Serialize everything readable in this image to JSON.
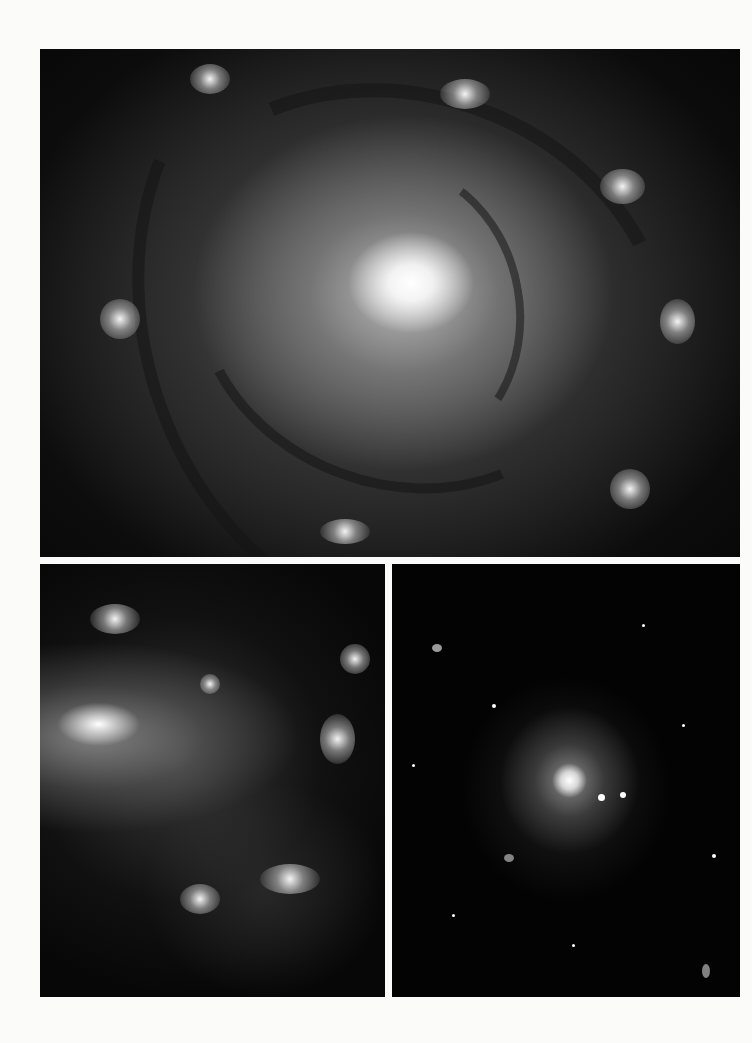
{
  "page": {
    "background_color": "#fbfbfa",
    "layout": "photo-plate: one wide image on top, two images side by side below"
  },
  "images": [
    {
      "id": "top",
      "subject": "face-on spiral galaxy with tightly wound arms and bright core",
      "rect": {
        "x": 40,
        "y": 49,
        "w": 700,
        "h": 508
      }
    },
    {
      "id": "bottom-left",
      "subject": "irregular galaxy close-up with bright knot and star-forming clusters",
      "rect": {
        "x": 40,
        "y": 564,
        "w": 345,
        "h": 433
      }
    },
    {
      "id": "bottom-right",
      "subject": "elliptical galaxy in a dense star field",
      "rect": {
        "x": 392,
        "y": 564,
        "w": 348,
        "h": 433
      }
    }
  ]
}
